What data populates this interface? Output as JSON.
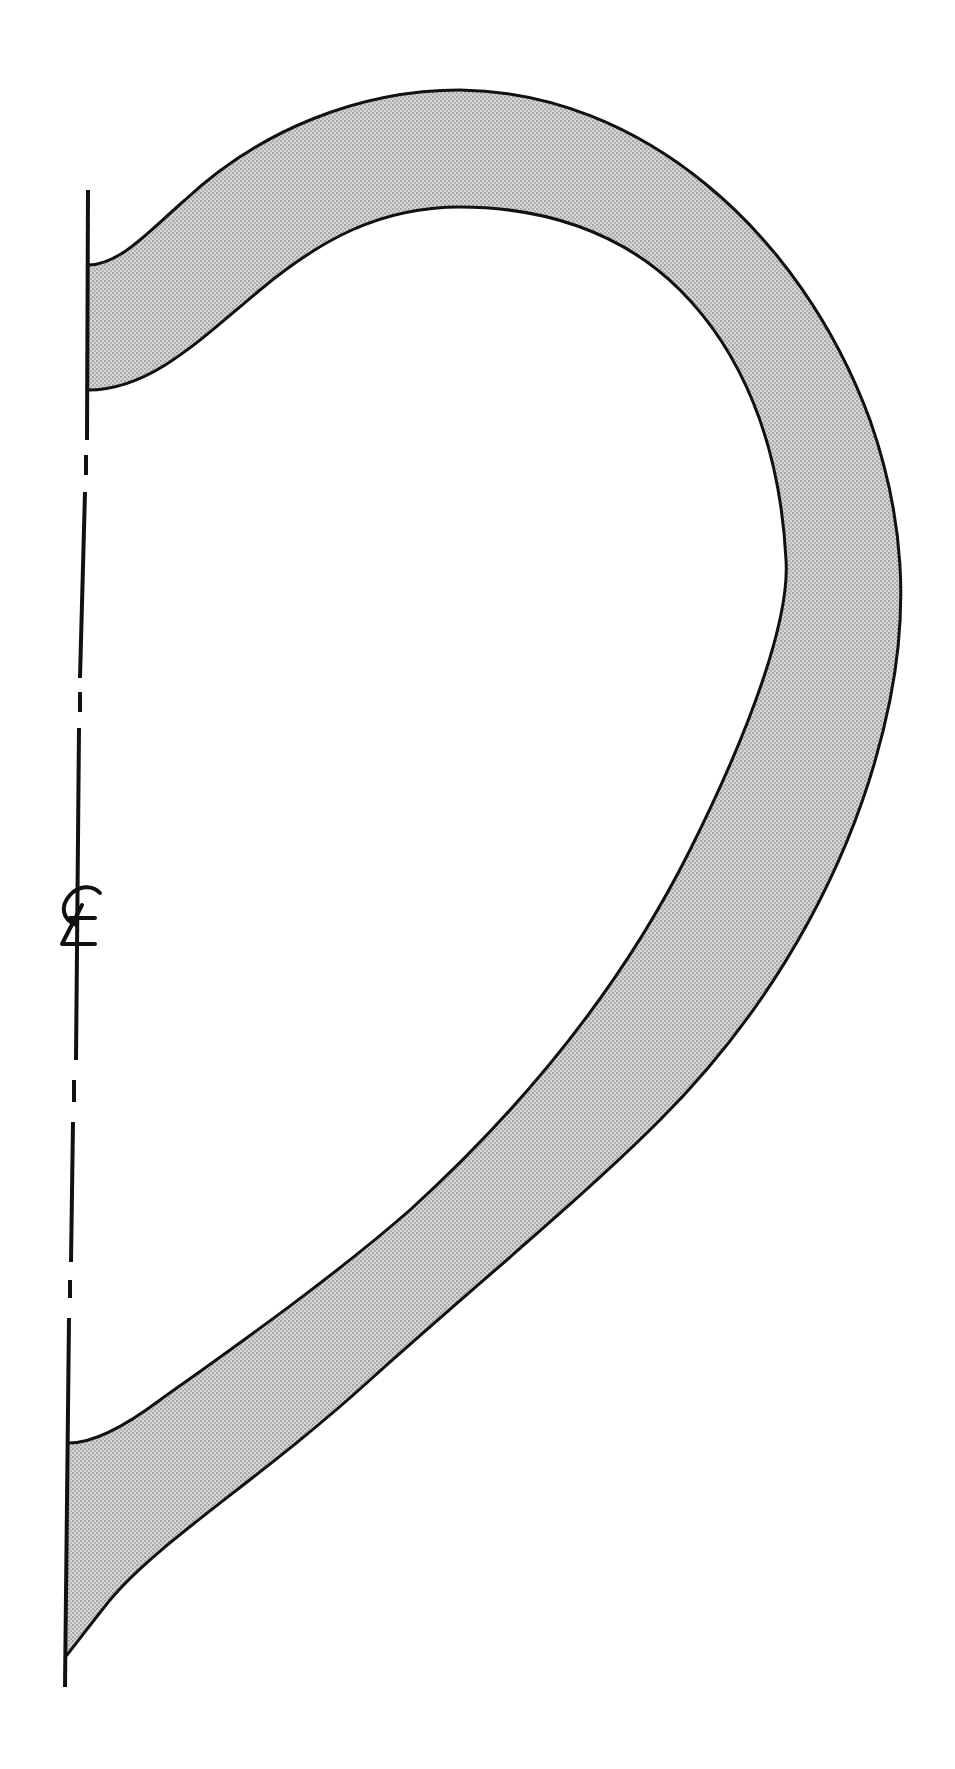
{
  "figure": {
    "type": "vessel profile section drawing",
    "centerline_symbol": "℄",
    "centerline_label": "Centerline",
    "colors": {
      "line": "#111111",
      "section_fill": "#c8c8c8",
      "background": "#ffffff"
    },
    "parts": [
      {
        "name": "wall-section",
        "description": "Shaded wall cross-section (S-shaped profile)"
      },
      {
        "name": "axis",
        "description": "Vertical dash-dot centerline with ℄ mark"
      }
    ]
  }
}
